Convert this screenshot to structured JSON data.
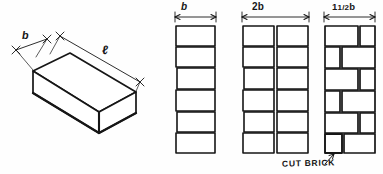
{
  "figure": {
    "background_color": "#fefefe",
    "ink_color": "#161616"
  },
  "brick_isometric": {
    "name": "isometric-brick",
    "dimension_labels": {
      "width": "b",
      "length": "ℓ"
    }
  },
  "wall_columns": [
    {
      "id": "column-b",
      "header": "b",
      "description": "single-brick-width wall, six courses stacked",
      "courses": 6,
      "bricks_per_course": 1,
      "has_cut_bricks": false
    },
    {
      "id": "column-2b",
      "header": "2b",
      "description": "two-brick-width wall, six courses, two full bricks per course",
      "courses": 6,
      "bricks_per_course": 2,
      "has_cut_bricks": false
    },
    {
      "id": "column-1.5b",
      "header_prefix": "1",
      "header_fraction": "1/2",
      "header_suffix": "b",
      "header": "1½b",
      "description": "one-and-a-half-brick-width wall, alternating full and cut bricks",
      "courses": 6,
      "bricks_per_course": 2,
      "has_cut_bricks": true
    }
  ],
  "annotations": {
    "cut_brick_label": "CUT BRICK",
    "cut_brick_target": "half brick in bottom course of 1½b wall"
  }
}
